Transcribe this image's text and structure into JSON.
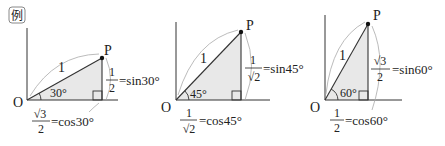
{
  "badge": {
    "label": "例"
  },
  "colors": {
    "line": "#333333",
    "fill": "#e8e8e8",
    "arc": "#999999"
  },
  "diagrams": [
    {
      "angle_label": "30°",
      "point_label": "P",
      "origin_label": "O",
      "hyp_label": "1",
      "sin": {
        "num": "1",
        "den": "2",
        "eq": "=sin30°"
      },
      "cos": {
        "num": "√3",
        "den": "2",
        "eq": "=cos30°"
      }
    },
    {
      "angle_label": "45°",
      "point_label": "P",
      "origin_label": "O",
      "hyp_label": "1",
      "sin": {
        "num": "1",
        "den": "√2",
        "eq": "=sin45°"
      },
      "cos": {
        "num": "1",
        "den": "√2",
        "eq": "=cos45°"
      }
    },
    {
      "angle_label": "60°",
      "point_label": "P",
      "origin_label": "O",
      "hyp_label": "1",
      "sin": {
        "num": "√3",
        "den": "2",
        "eq": "=sin60°"
      },
      "cos": {
        "num": "1",
        "den": "2",
        "eq": "=cos60°"
      }
    }
  ]
}
